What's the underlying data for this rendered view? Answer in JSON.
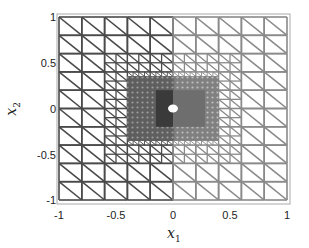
{
  "chart_data": {
    "type": "mesh",
    "title": "",
    "xlabel": "x_1",
    "ylabel": "x_2",
    "xlim": [
      -1,
      1
    ],
    "ylim": [
      -1,
      1
    ],
    "xticks": [
      -1,
      -0.5,
      0,
      0.5,
      1
    ],
    "yticks": [
      -1,
      -0.5,
      0,
      0.5,
      1
    ],
    "xtick_labels": [
      "-1",
      "-0.5",
      "0",
      "0.5",
      "1"
    ],
    "ytick_labels": [
      "1",
      "0.5",
      "0",
      "-0.5",
      "-1"
    ],
    "grid": false,
    "coarse_divisions": 10,
    "refined_region": {
      "x": [
        -0.4,
        0.4
      ],
      "y": [
        -0.35,
        0.35
      ]
    },
    "densest_region": {
      "x": [
        -0.15,
        0.28
      ],
      "y": [
        -0.2,
        0.2
      ]
    },
    "hole": {
      "center": [
        0,
        0
      ],
      "radius": 0.04
    },
    "colors": {
      "mesh_left": "#4a4a4a",
      "mesh_right": "#8a8a8a",
      "dense_left": "#3a3a3a",
      "dense_right": "#6e6e6e",
      "hole": "#ffffff",
      "frame": "#999999"
    }
  },
  "axes": {
    "xlabel_main": "x",
    "xlabel_sub": "1",
    "ylabel_main": "x",
    "ylabel_sub": "2"
  }
}
